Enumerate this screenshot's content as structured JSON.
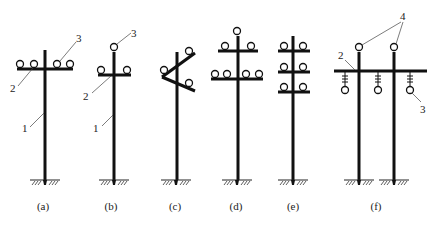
{
  "figure": {
    "captions": [
      "(a)",
      "(b)",
      "(c)",
      "(d)",
      "(e)",
      "(f)"
    ],
    "callouts": {
      "a": {
        "pole": "1",
        "crossarm": "2",
        "insulator": "3"
      },
      "b": {
        "pole": "1",
        "crossarm": "2",
        "insulator": "3"
      },
      "f": {
        "crossarm": "2",
        "suspension_insulator": "3",
        "top_insulators": "4"
      }
    }
  }
}
